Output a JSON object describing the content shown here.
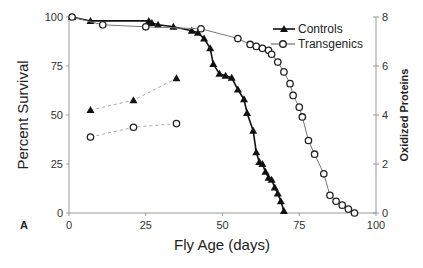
{
  "chart_data": {
    "type": "line",
    "panel_label": "A",
    "title": "",
    "xlabel": "Fly Age (days)",
    "ylabel": "Percent Survival",
    "y2label": "Oxidized Proteins",
    "xlim": [
      0,
      100
    ],
    "ylim": [
      0,
      100
    ],
    "y2lim": [
      0,
      8
    ],
    "xticks": [
      "0",
      "25",
      "50",
      "75",
      "100"
    ],
    "yticks": [
      "0",
      "25",
      "50",
      "75",
      "100"
    ],
    "y2ticks": [
      "0",
      "2",
      "4",
      "6",
      "8"
    ],
    "grid": false,
    "legend_position": "upper right",
    "legend": [
      "Controls",
      "Transgenics"
    ],
    "series": [
      {
        "name": "Controls",
        "kind": "survival",
        "axis": "left",
        "marker": "filled-triangle",
        "line": "solid-thick",
        "x": [
          1,
          7,
          26,
          27,
          29,
          34,
          40,
          42,
          44,
          46,
          47,
          49,
          51,
          53,
          55,
          57,
          58,
          60,
          61,
          62,
          63,
          64,
          65,
          66,
          67,
          68,
          69,
          70
        ],
        "y": [
          100,
          98,
          98,
          97,
          96,
          95,
          93,
          92,
          89,
          84,
          76,
          71,
          70,
          69,
          63,
          58,
          51,
          42,
          31,
          26,
          25,
          21,
          18,
          17,
          13,
          10,
          6,
          1
        ]
      },
      {
        "name": "Transgenics",
        "kind": "survival",
        "axis": "left",
        "marker": "open-circle",
        "line": "solid-thin",
        "x": [
          1,
          11,
          25,
          43,
          55,
          59,
          61,
          63,
          65,
          66,
          68,
          70,
          72,
          73,
          75,
          76,
          78,
          80,
          83,
          85,
          87,
          89,
          91,
          93
        ],
        "y": [
          100,
          96,
          95,
          94,
          89,
          86,
          85,
          84,
          83,
          81,
          77,
          72,
          66,
          60,
          54,
          49,
          37,
          30,
          20,
          9,
          6,
          4,
          2,
          0
        ]
      },
      {
        "name": "Controls",
        "kind": "oxidized_proteins",
        "axis": "right",
        "marker": "filled-triangle",
        "line": "dashed",
        "x": [
          7,
          21,
          35
        ],
        "y": [
          4.2,
          4.6,
          5.5
        ]
      },
      {
        "name": "Transgenics",
        "kind": "oxidized_proteins",
        "axis": "right",
        "marker": "open-circle",
        "line": "dashed",
        "x": [
          7,
          21,
          35
        ],
        "y": [
          3.1,
          3.5,
          3.65
        ]
      }
    ]
  }
}
